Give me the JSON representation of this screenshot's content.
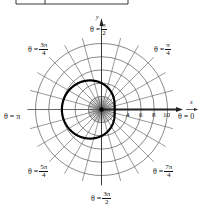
{
  "chart_data": {
    "type": "line",
    "subtype": "polar",
    "title": "",
    "equation": "r = 4 - 2cos(theta)",
    "series": [
      {
        "name": "limacon",
        "theta_samples_rad": [
          0,
          0.7854,
          1.5708,
          2.3562,
          3.1416,
          3.927,
          4.7124,
          5.4978,
          6.2832
        ],
        "r_values": [
          2,
          2.59,
          4,
          5.41,
          6,
          5.41,
          4,
          2.59,
          2
        ]
      }
    ],
    "radial_grid": [
      2,
      4,
      6,
      8,
      10
    ],
    "radial_max": 10,
    "angular_grid_step_deg": 15,
    "tick_labels": [
      "4",
      "6",
      "8",
      "10"
    ],
    "angle_labels": [
      {
        "id": "0",
        "text": "θ = 0"
      },
      {
        "id": "pi4",
        "prefix": "θ =",
        "num": "π",
        "den": "4"
      },
      {
        "id": "pi2",
        "prefix": "θ =",
        "num": "π",
        "den": "2"
      },
      {
        "id": "3pi4",
        "prefix": "θ =",
        "num": "3π",
        "den": "4"
      },
      {
        "id": "pi",
        "text": "θ = π"
      },
      {
        "id": "5pi4",
        "prefix": "θ =",
        "num": "5π",
        "den": "4"
      },
      {
        "id": "3pi2",
        "prefix": "θ =",
        "num": "3π",
        "den": "2"
      },
      {
        "id": "7pi4",
        "prefix": "θ =",
        "num": "7π",
        "den": "4"
      }
    ],
    "xlabel": "x",
    "ylabel": "y",
    "grid": true,
    "legend": null
  },
  "style": {
    "grid_color": "#555555",
    "curve_color": "#000000",
    "axis_color": "#222222"
  },
  "labels": {
    "x_axis": "x",
    "y_axis": "y",
    "tick_4": "4",
    "tick_6": "6",
    "tick_8": "8",
    "tick_10": "10",
    "theta_0": "θ = 0",
    "theta_pi": "θ = π",
    "prefix": "θ =",
    "pi": "π",
    "three_pi": "3π",
    "five_pi": "5π",
    "seven_pi": "7π",
    "two": "2",
    "four": "4"
  }
}
